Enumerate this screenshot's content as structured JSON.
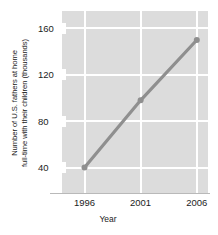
{
  "chart_data": {
    "type": "line",
    "title": "",
    "xlabel": "Year",
    "ylabel_line1": "Number of U.S. fathers at home",
    "ylabel_line2": "full-time with their children (thousands)",
    "ylabel": "Number of U.S. fathers at home full-time with their children (thousands)",
    "x": [
      1996,
      2001,
      2006
    ],
    "values": [
      40,
      98,
      150
    ],
    "categories": [
      "1996",
      "2001",
      "2006"
    ],
    "xtick_labels": [
      "1996",
      "2001",
      "2006"
    ],
    "ytick_labels": [
      "160",
      "120",
      "80",
      "40"
    ],
    "ytick_values": [
      160,
      120,
      80,
      40
    ],
    "xlim": [
      1994.0,
      2007.0
    ],
    "ylim": [
      18,
      175
    ],
    "grid": true,
    "legend": "none",
    "series": [
      {
        "name": "U.S. stay-at-home fathers",
        "values": [
          40,
          98,
          150
        ]
      }
    ],
    "colors": {
      "line": "#8f8f8f",
      "marker": "#8f8f8f",
      "plot_background": "#dcdcdc",
      "gridline": "#ffffff",
      "text": "#1c1c1c",
      "axis": "#b9b9b9"
    }
  }
}
